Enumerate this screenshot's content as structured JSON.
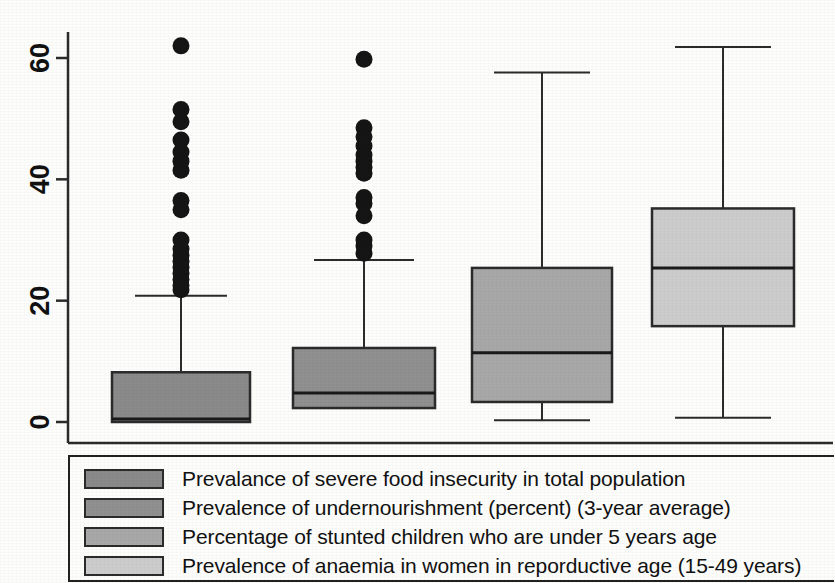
{
  "chart_data": {
    "type": "box",
    "title": "",
    "xlabel": "",
    "ylabel": "",
    "ylim": [
      -2,
      64
    ],
    "grid": false,
    "legend_position": "bottom",
    "y_ticks": [
      0,
      20,
      40,
      60
    ],
    "y_tick_labels": [
      "0",
      "20",
      "40",
      "60"
    ],
    "categories": [
      "Prevalance of severe food insecurity in total population",
      "Prevalence of undernourishment (percent) (3-year average)",
      "Percentage of stunted children who are under 5 years age",
      "Prevalence of anaemia in women in reporductive age (15-49 years)"
    ],
    "boxes": [
      {
        "name": "Prevalance of severe food insecurity in total population",
        "color": "#8a8a8a",
        "whisker_low": 0.0,
        "q1": 0.0,
        "median": 0.5,
        "q3": 8.2,
        "whisker_high": 20.8,
        "outliers": [
          62.0,
          51.5,
          49.5,
          46.5,
          44.5,
          43.0,
          41.5,
          36.5,
          35.0,
          30.0,
          28.5,
          27.5,
          26.5,
          25.5,
          24.5,
          23.5,
          22.5,
          21.8
        ]
      },
      {
        "name": "Prevalence of undernourishment (percent) (3-year average)",
        "color": "#909090",
        "whisker_low": 2.3,
        "q1": 2.3,
        "median": 4.8,
        "q3": 12.2,
        "whisker_high": 26.7,
        "outliers": [
          59.8,
          48.5,
          47.0,
          45.5,
          44.0,
          43.0,
          42.0,
          41.0,
          37.0,
          36.0,
          34.0,
          30.0,
          29.0,
          27.8
        ]
      },
      {
        "name": "Percentage of stunted children who are under 5 years age",
        "color": "#a8a8a8",
        "whisker_low": 0.3,
        "q1": 3.3,
        "median": 11.4,
        "q3": 25.4,
        "whisker_high": 57.6,
        "outliers": []
      },
      {
        "name": "Prevalence of anaemia in women in reporductive age (15-49 years)",
        "color": "#cccccc",
        "whisker_low": 0.7,
        "q1": 15.8,
        "median": 25.4,
        "q3": 35.2,
        "whisker_high": 61.8,
        "outliers": []
      }
    ]
  },
  "legend": {
    "items": [
      {
        "label": "Prevalance of severe food insecurity in total population",
        "color": "#8a8a8a"
      },
      {
        "label": "Prevalence of undernourishment (percent) (3-year average)",
        "color": "#909090"
      },
      {
        "label": "Percentage of stunted children who are under 5 years age",
        "color": "#a8a8a8"
      },
      {
        "label": "Prevalence of anaemia in women in reporductive age (15-49 years)",
        "color": "#cccccc"
      }
    ]
  }
}
